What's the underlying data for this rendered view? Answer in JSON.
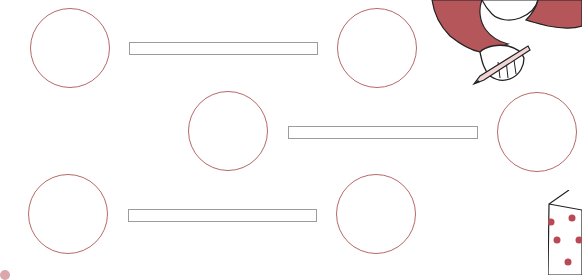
{
  "worksheet": {
    "type": "matching-exercise",
    "rows": [
      {
        "left_circle": "empty",
        "answer_box": "empty",
        "right_circle": "empty"
      },
      {
        "left_circle": "empty",
        "answer_box": "empty",
        "right_circle": "empty"
      },
      {
        "left_circle": "empty",
        "answer_box": "empty",
        "right_circle": "empty"
      }
    ],
    "decorations": [
      {
        "name": "furry-arm-holding-pencil",
        "position": "top-right"
      },
      {
        "name": "polka-dot-gift-box",
        "position": "bottom-right"
      }
    ]
  },
  "colors": {
    "circle_stroke": "#b56a68",
    "box_stroke": "#9c9c9c",
    "fur": "#b5575a",
    "dots": "#b94a55"
  }
}
